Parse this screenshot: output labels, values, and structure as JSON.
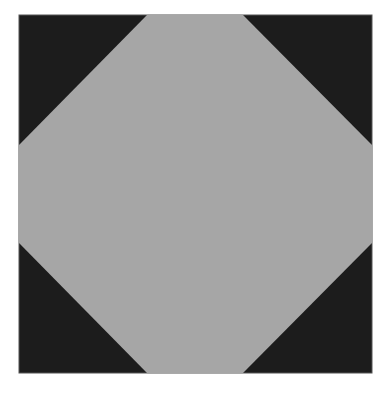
{
  "figure": {
    "background": "#ffffff",
    "square": {
      "x": 19,
      "y": 15,
      "width": 353,
      "height": 358,
      "fill": "#1c1c1c",
      "stroke": "#555555"
    },
    "octagon": {
      "fill": "#a6a6a6",
      "points": "147,15 243,15 372,145 372,243 243,373 147,373 19,243 19,145"
    }
  }
}
